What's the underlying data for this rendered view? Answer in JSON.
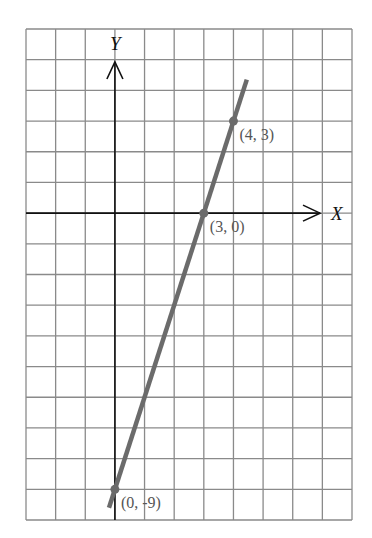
{
  "chart_data": {
    "type": "line",
    "title": "",
    "xlabel": "X",
    "ylabel": "Y",
    "xlim": [
      -3,
      8
    ],
    "ylim": [
      -10,
      6
    ],
    "grid": true,
    "grid_unit": 1,
    "series": [
      {
        "name": "y = 3x - 9",
        "equation": "y = 3x - 9",
        "color": "#6b6b6b",
        "line_extent": {
          "x": [
            -0.2,
            4.45
          ],
          "y": [
            -9.6,
            4.35
          ]
        },
        "points": [
          {
            "x": 0,
            "y": -9,
            "label": "(0, -9)"
          },
          {
            "x": 3,
            "y": 0,
            "label": "(3, 0)"
          },
          {
            "x": 4,
            "y": 3,
            "label": "(4, 3)"
          }
        ]
      }
    ]
  },
  "colors": {
    "grid": "#8a8a8a",
    "axes": "#111111",
    "line": "#6b6b6b",
    "label_text": "#555555"
  }
}
